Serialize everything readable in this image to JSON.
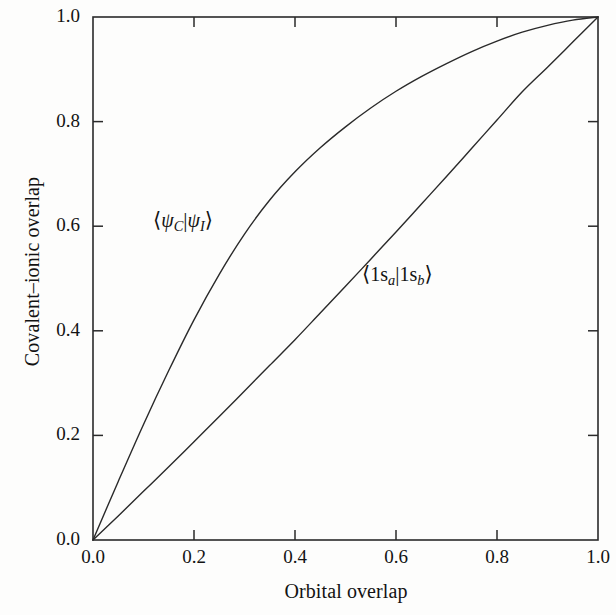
{
  "figure": {
    "background_color": "#fdfdfc",
    "line_color": "#2a2a2a",
    "text_color": "#131313"
  },
  "axes": {
    "x_title": "Orbital overlap",
    "y_title": "Covalent–ionic overlap",
    "x_ticks": [
      "0.0",
      "0.2",
      "0.4",
      "0.6",
      "0.8",
      "1.0"
    ],
    "y_ticks": [
      "0.0",
      "0.2",
      "0.4",
      "0.6",
      "0.8",
      "1.0"
    ]
  },
  "annotations": {
    "upper_curve_label": {
      "bra": "⟨",
      "psi1": "ψ",
      "sub1": "C",
      "bar": "|",
      "psi2": "ψ",
      "sub2": "I",
      "ket": "⟩",
      "plain": "⟨ψC|ψI⟩"
    },
    "lower_curve_label": {
      "bra": "⟨",
      "lead1": "1s",
      "sub1": "a",
      "bar": "|",
      "lead2": "1s",
      "sub2": "b",
      "ket": "⟩",
      "plain": "⟨1sa|1sb⟩"
    }
  },
  "chart_data": {
    "type": "line",
    "title": "",
    "xlabel": "Orbital overlap",
    "ylabel": "Covalent–ionic overlap",
    "xlim": [
      0.0,
      1.0
    ],
    "ylim": [
      0.0,
      1.0
    ],
    "grid": false,
    "legend": "inline-annotations",
    "xticks": [
      0.0,
      0.2,
      0.4,
      0.6,
      0.8,
      1.0
    ],
    "yticks": [
      0.0,
      0.2,
      0.4,
      0.6,
      0.8,
      1.0
    ],
    "x": [
      0.0,
      0.05,
      0.1,
      0.15,
      0.2,
      0.25,
      0.3,
      0.35,
      0.4,
      0.45,
      0.5,
      0.55,
      0.6,
      0.65,
      0.7,
      0.75,
      0.8,
      0.85,
      0.9,
      0.95,
      1.0
    ],
    "series": [
      {
        "name": "⟨ψC|ψI⟩",
        "label_position": {
          "x": 0.21,
          "y": 0.6
        },
        "values": [
          0.0,
          0.112,
          0.221,
          0.324,
          0.421,
          0.508,
          0.585,
          0.65,
          0.704,
          0.75,
          0.79,
          0.826,
          0.858,
          0.886,
          0.911,
          0.934,
          0.954,
          0.971,
          0.984,
          0.994,
          1.0
        ]
      },
      {
        "name": "⟨1sa|1sb⟩",
        "label_position": {
          "x": 0.62,
          "y": 0.45
        },
        "values": [
          0.0,
          0.046,
          0.093,
          0.14,
          0.188,
          0.236,
          0.285,
          0.334,
          0.383,
          0.434,
          0.485,
          0.537,
          0.589,
          0.642,
          0.695,
          0.749,
          0.803,
          0.857,
          0.904,
          0.952,
          1.0
        ]
      }
    ]
  }
}
